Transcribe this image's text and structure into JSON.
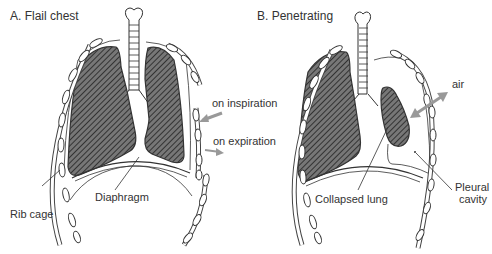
{
  "panels": [
    {
      "title": "A. Flail chest",
      "labels": {
        "inspiration": "on inspiration",
        "expiration": "on expiration",
        "rib_cage": "Rib cage",
        "diaphragm": "Diaphragm"
      }
    },
    {
      "title": "B. Penetrating",
      "labels": {
        "air": "air",
        "collapsed_lung": "Collapsed lung",
        "pleural_1": "Pleural",
        "pleural_2": "cavity"
      }
    }
  ],
  "colors": {
    "line": "#333333",
    "lung_fill": "#6a6a6a",
    "arrow": "#9a9a9a",
    "text": "#333333"
  }
}
